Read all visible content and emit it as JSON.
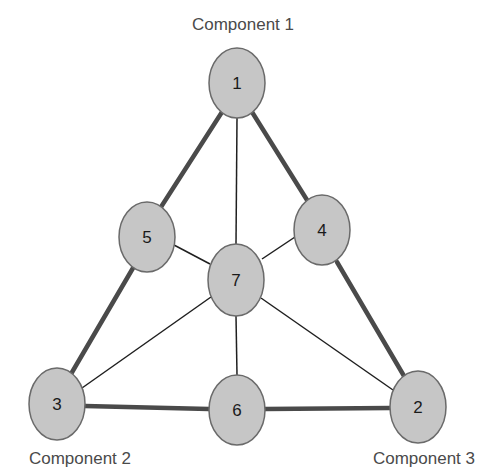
{
  "diagram": {
    "type": "ternary-mixture-design",
    "vertex_labels": {
      "top": "Component 1",
      "bottom_left": "Component 2",
      "bottom_right": "Component 3"
    },
    "nodes": [
      {
        "id": "1",
        "label": "1",
        "cx": 237,
        "cy": 83
      },
      {
        "id": "2",
        "label": "2",
        "cx": 418,
        "cy": 407
      },
      {
        "id": "3",
        "label": "3",
        "cx": 57,
        "cy": 404
      },
      {
        "id": "4",
        "label": "4",
        "cx": 322,
        "cy": 230
      },
      {
        "id": "5",
        "label": "5",
        "cx": 147,
        "cy": 237
      },
      {
        "id": "6",
        "label": "6",
        "cx": 237,
        "cy": 410
      },
      {
        "id": "7",
        "label": "7",
        "cx": 236,
        "cy": 280
      }
    ],
    "thick_edges": [
      [
        "1",
        "5"
      ],
      [
        "5",
        "3"
      ],
      [
        "1",
        "4"
      ],
      [
        "4",
        "2"
      ],
      [
        "3",
        "6"
      ],
      [
        "6",
        "2"
      ]
    ],
    "thin_edges": [
      [
        "1",
        "7"
      ],
      [
        "5",
        "7"
      ],
      [
        "4",
        "7"
      ],
      [
        "3",
        "7"
      ],
      [
        "2",
        "7"
      ],
      [
        "6",
        "7"
      ]
    ],
    "colors": {
      "node_fill": "#c6c6c6",
      "node_stroke": "#6a6a6a",
      "thick_edge": "#4a4a4a",
      "thin_edge": "#1f1f1f",
      "label_text": "#4a4a4a"
    }
  }
}
